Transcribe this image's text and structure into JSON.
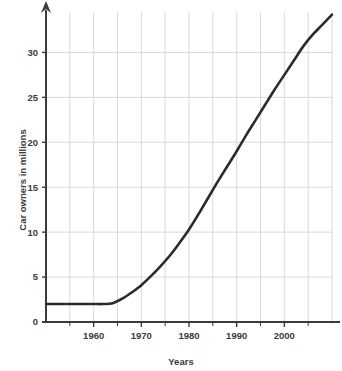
{
  "chart_data": {
    "type": "line",
    "title": "",
    "xlabel": "Years",
    "ylabel": "Car owners in millions",
    "xlim": [
      1950,
      2010
    ],
    "ylim": [
      0,
      34.5
    ],
    "grid": true,
    "legend_position": "none",
    "x_ticks_major": [
      1960,
      1970,
      1980,
      1990,
      2000
    ],
    "x_tick_labels": [
      "1960",
      "1970",
      "1980",
      "1990",
      "2000"
    ],
    "x_ticks_minor": [
      1955,
      1965,
      1975,
      1985,
      1995,
      2005
    ],
    "y_ticks": [
      0,
      5,
      10,
      15,
      20,
      25,
      30
    ],
    "y_tick_labels": [
      "0",
      "5",
      "10",
      "15",
      "20",
      "25",
      "30"
    ],
    "series": [
      {
        "name": "Car owners",
        "x": [
          1950,
          1955,
          1960,
          1962,
          1964,
          1966,
          1968,
          1970,
          1972,
          1974,
          1976,
          1978,
          1980,
          1982,
          1984,
          1986,
          1988,
          1990,
          1992,
          1994,
          1996,
          1998,
          2000,
          2002,
          2004,
          2006,
          2008,
          2010
        ],
        "values": [
          2.0,
          2.0,
          2.0,
          2.0,
          2.1,
          2.6,
          3.3,
          4.1,
          5.1,
          6.2,
          7.4,
          8.8,
          10.3,
          12.0,
          13.8,
          15.6,
          17.3,
          19.0,
          20.8,
          22.5,
          24.2,
          25.9,
          27.5,
          29.1,
          30.7,
          32.0,
          33.1,
          34.2
        ]
      }
    ],
    "colors": {
      "line": "#2b2b2b",
      "grid": "#d9d9d9",
      "axis": "#3b3b3b",
      "text": "#3b3b3b",
      "background": "#ffffff"
    }
  }
}
